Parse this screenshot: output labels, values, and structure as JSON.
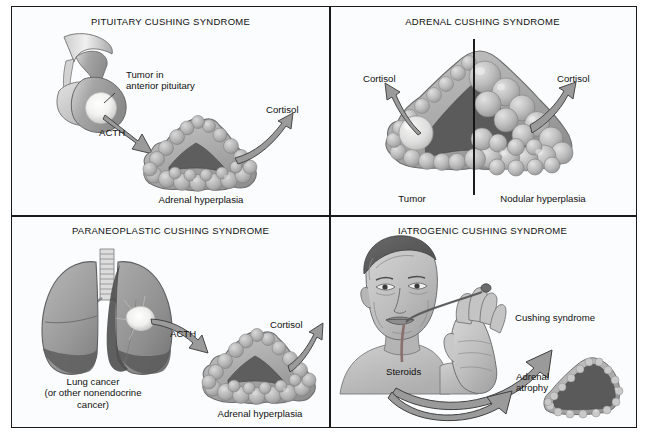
{
  "panels": [
    {
      "id": "pituitary",
      "title": "PITUITARY CUSHING SYNDROME",
      "labels": {
        "tumor_line1": "Tumor in",
        "tumor_line2": "anterior pituitary",
        "acth": "ACTH",
        "cortisol": "Cortisol",
        "gland": "Adrenal hyperplasia"
      }
    },
    {
      "id": "adrenal",
      "title": "ADRENAL CUSHING SYNDROME",
      "labels": {
        "cortisol_left": "Cortisol",
        "cortisol_right": "Cortisol",
        "tumor": "Tumor",
        "nodular": "Nodular hyperplasia"
      }
    },
    {
      "id": "paraneoplastic",
      "title": "PARANEOPLASTIC CUSHING SYNDROME",
      "labels": {
        "lung_line1": "Lung cancer",
        "lung_line2": "(or other nonendocrine",
        "lung_line3": "cancer)",
        "acth": "ACTH",
        "cortisol": "Cortisol",
        "gland": "Adrenal hyperplasia"
      }
    },
    {
      "id": "iatrogenic",
      "title": "IATROGENIC CUSHING SYNDROME",
      "labels": {
        "steroids": "Steroids",
        "cushing": "Cushing syndrome",
        "atrophy_line1": "Adrenal",
        "atrophy_line2": "atrophy"
      }
    }
  ],
  "colors": {
    "frame_border": "#1a1a1a",
    "panel_background": "#fbfcfd",
    "text": "#111111",
    "tissue_mid": "#9a9a9a",
    "tissue_light": "#c9c9c9",
    "tissue_dark": "#6a6a6a",
    "medulla_dark": "#555555",
    "arrow_fill": "#8c8c8c",
    "arrow_stroke": "#3a3a3a",
    "tumor_pale": "#e8e8e4"
  }
}
